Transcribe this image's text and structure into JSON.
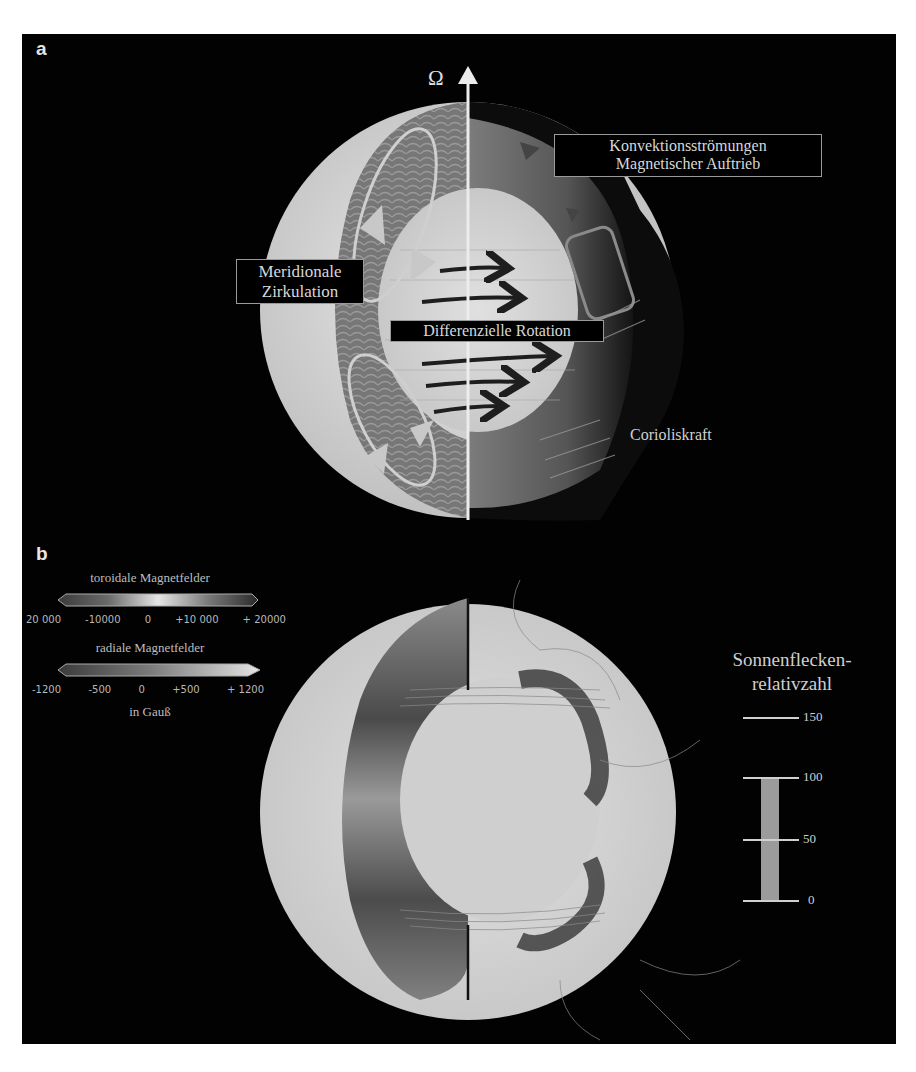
{
  "figure": {
    "panel_a": {
      "letter": "a",
      "axis_symbol": "Ω",
      "labels": {
        "convection_line1": "Konvektionsströmungen",
        "convection_line2": "Magnetischer Auftrieb",
        "meridional_line1": "Meridionale",
        "meridional_line2": "Zirkulation",
        "differential_rotation": "Differenzielle Rotation",
        "coriolis": "Corioliskraft"
      }
    },
    "panel_b": {
      "letter": "b",
      "toroidal_colorbar": {
        "title": "toroidale Magnetfelder",
        "ticks": [
          "20 000",
          "-10000",
          "0",
          "+10 000",
          "+ 20000"
        ]
      },
      "radial_colorbar": {
        "title": "radiale Magnetfelder",
        "ticks": [
          "-1200",
          "-500",
          "0",
          "+500",
          "+ 1200"
        ],
        "unit": "in Gauß"
      },
      "sunspot_scale": {
        "title_line1": "Sonnenflecken-",
        "title_line2": "relativzahl",
        "ticks": [
          "150",
          "100",
          "50",
          "0"
        ],
        "current_value": 125,
        "max": 150
      }
    }
  },
  "colors": {
    "background": "#020202",
    "page": "#ffffff",
    "label_text": "#d8d8d8",
    "label_border": "#9a9a9a",
    "sunspot_bar": "#9b9b9b"
  }
}
